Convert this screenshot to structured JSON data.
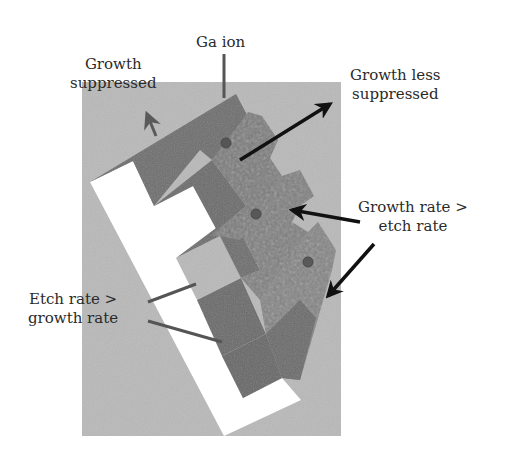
{
  "labels": {
    "ga_ion": "Ga ion",
    "growth_suppressed": [
      "Growth",
      "suppressed"
    ],
    "growth_less_suppressed": [
      "Growth less",
      "suppressed"
    ],
    "growth_gt_etch": [
      "Growth rate >",
      "etch rate"
    ],
    "etch_gt_growth": [
      "Etch rate >",
      "growth rate"
    ]
  },
  "colors": {
    "background": "#ffffff",
    "substrate_gray": "#b9b9b9",
    "white_face": "#ffffff",
    "block_dark": "#6e6e6e",
    "block_mid": "#7c7c7c",
    "block_rough": "#858585",
    "ion_dot": "#555555",
    "arrow": "#111111",
    "leader_line": "#555555"
  },
  "ions": [
    {
      "x": 226,
      "y": 143
    },
    {
      "x": 256,
      "y": 214
    },
    {
      "x": 308,
      "y": 262
    }
  ]
}
